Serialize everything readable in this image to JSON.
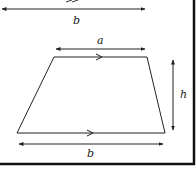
{
  "diagram": {
    "colors": {
      "stroke": "#222222",
      "border": "#111111",
      "background": "#ffffff"
    },
    "upper_fragment": {
      "base_label": "b"
    },
    "trapezium": {
      "top_label": "a",
      "bottom_label": "b",
      "height_label": "h"
    }
  }
}
